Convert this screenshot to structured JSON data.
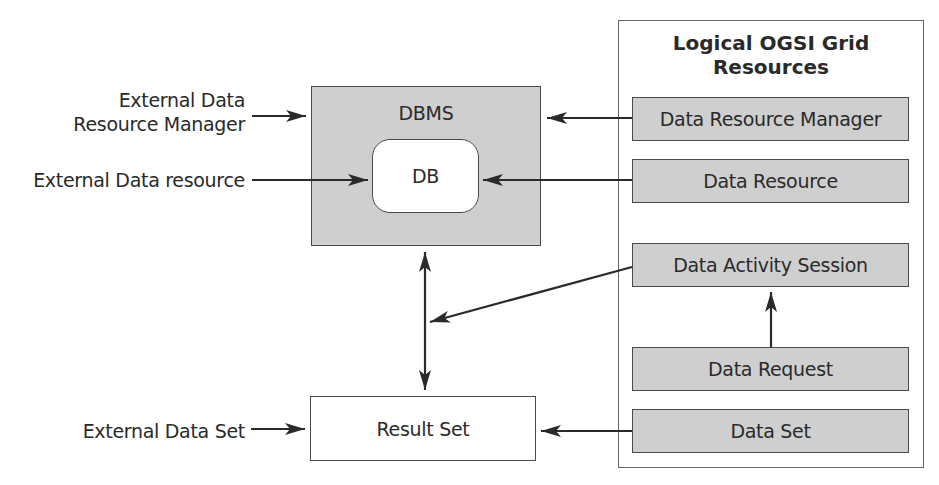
{
  "diagram": {
    "external": {
      "data_resource_manager": [
        "External Data",
        "Resource Manager"
      ],
      "data_resource": "External Data resource",
      "data_set": "External Data Set"
    },
    "dbms": {
      "label": "DBMS",
      "db_label": "DB"
    },
    "result_set": {
      "label": "Result Set"
    },
    "grid_panel": {
      "title": [
        "Logical OGSI Grid",
        "Resources"
      ],
      "items": [
        {
          "label": "Data Resource Manager"
        },
        {
          "label": "Data Resource"
        },
        {
          "label": "Data Activity Session"
        },
        {
          "label": "Data Request"
        },
        {
          "label": "Data Set"
        }
      ]
    },
    "edges": [
      {
        "from": "External Data Resource Manager",
        "to": "DBMS"
      },
      {
        "from": "External Data resource",
        "to": "DB"
      },
      {
        "from": "External Data Set",
        "to": "Result Set"
      },
      {
        "from": "Data Resource Manager",
        "to": "DBMS"
      },
      {
        "from": "Data Resource",
        "to": "DB"
      },
      {
        "from": "DBMS",
        "to": "Result Set",
        "bidirectional": true
      },
      {
        "from": "Data Activity Session",
        "to": "DBMS-Result Set link"
      },
      {
        "from": "Data Request",
        "to": "Data Activity Session"
      },
      {
        "from": "Data Set",
        "to": "Result Set"
      }
    ],
    "colors": {
      "box_fill": "#cfcfcf",
      "stroke": "#2a2a2a",
      "background": "#ffffff"
    }
  }
}
